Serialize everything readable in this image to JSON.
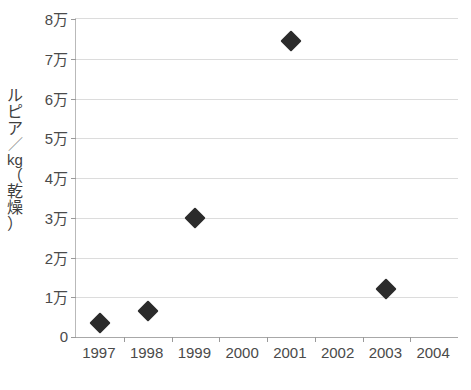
{
  "chart_data": {
    "type": "scatter",
    "title": "",
    "xlabel": "",
    "ylabel": "ルピア／kg（乾燥）",
    "ylabel_chars": [
      "ル",
      "ピ",
      "ア",
      "／",
      "kg",
      "（",
      "乾",
      "燥",
      "）"
    ],
    "categories": [
      "1997",
      "1998",
      "1999",
      "2000",
      "2001",
      "2002",
      "2003",
      "2004"
    ],
    "series": [
      {
        "name": "価格",
        "values": [
          3500,
          6500,
          30000,
          null,
          74500,
          null,
          12000,
          null
        ]
      }
    ],
    "points": [
      {
        "x": "1997",
        "y": 3500
      },
      {
        "x": "1998",
        "y": 6500
      },
      {
        "x": "1999",
        "y": 30000
      },
      {
        "x": "2001",
        "y": 74500
      },
      {
        "x": "2003",
        "y": 12000
      }
    ],
    "ylim": [
      0,
      80000
    ],
    "ytick_values": [
      0,
      10000,
      20000,
      30000,
      40000,
      50000,
      60000,
      70000,
      80000
    ],
    "ytick_labels": [
      "0",
      "1万",
      "2万",
      "3万",
      "4万",
      "5万",
      "6万",
      "7万",
      "8万"
    ],
    "grid": true,
    "grid_axis": "y",
    "legend": false,
    "legend_position": "none",
    "marker_shape": "diamond",
    "marker_color": "#2b2b2b",
    "background_color": "#ffffff",
    "gridline_color": "#dcdcdc",
    "axis_color": "#a8a8a8",
    "text_color": "#4a4a4a"
  }
}
